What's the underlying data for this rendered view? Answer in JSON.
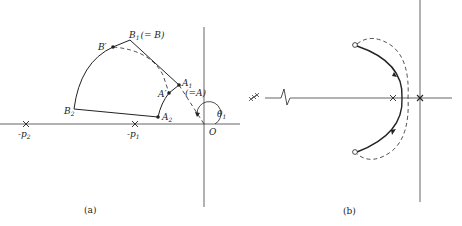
{
  "panel_a": {
    "caption": "(a)",
    "labels": {
      "B1": "B",
      "B1_sub": "1",
      "B1_eq": "(= B)",
      "B_prime": "B′",
      "A1": "A",
      "A1_sub": "1",
      "A1_eq": "(=A)",
      "A_prime": "A′",
      "A2": "A",
      "A2_sub": "2",
      "B2": "B",
      "B2_sub": "2",
      "origin": "O",
      "theta": "θ",
      "theta_sub": "1",
      "p1": "-p",
      "p1_sub": "1",
      "p2": "-p",
      "p2_sub": "2"
    }
  },
  "panel_b": {
    "caption": "(b)"
  },
  "colors": {
    "line": "#222222",
    "background": "#ffffff"
  }
}
